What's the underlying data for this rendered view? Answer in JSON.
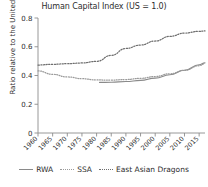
{
  "chart_data": {
    "type": "line",
    "title": "Human Capital Index (US = 1.0)",
    "xlabel": "",
    "ylabel": "Ratio relative to the United States",
    "xlim": [
      1960,
      2017
    ],
    "ylim": [
      0,
      0.8
    ],
    "yticks": [
      "0",
      "0.2",
      "0.4",
      "0.6",
      "0.8"
    ],
    "ytick_values": [
      0,
      0.2,
      0.4,
      0.6,
      0.8
    ],
    "xticks": [
      "1960",
      "1965",
      "1970",
      "1975",
      "1980",
      "1985",
      "1990",
      "1995",
      "2000",
      "2005",
      "2010",
      "2015"
    ],
    "xtick_values": [
      1960,
      1965,
      1970,
      1975,
      1980,
      1985,
      1990,
      1995,
      2000,
      2005,
      2010,
      2015
    ],
    "grid": false,
    "legend_position": "bottom",
    "series": [
      {
        "name": "RWA",
        "style": "solid",
        "color": "#8a8a8a",
        "x": [
          1981,
          1985,
          1990,
          1995,
          2000,
          2005,
          2010,
          2015,
          2017
        ],
        "values": [
          0.352,
          0.353,
          0.358,
          0.366,
          0.382,
          0.405,
          0.437,
          0.475,
          0.488
        ]
      },
      {
        "name": "SSA",
        "style": "fine-dotted",
        "color": "#9a9a9a",
        "x": [
          1960,
          1965,
          1970,
          1975,
          1980,
          1985,
          1990,
          1995,
          2000,
          2005,
          2010,
          2015,
          2017
        ],
        "values": [
          0.432,
          0.408,
          0.39,
          0.378,
          0.369,
          0.368,
          0.372,
          0.38,
          0.393,
          0.412,
          0.436,
          0.468,
          0.482
        ]
      },
      {
        "name": "East Asian Dragons",
        "style": "dotted",
        "color": "#6e6e6e",
        "x": [
          1960,
          1965,
          1970,
          1975,
          1980,
          1985,
          1990,
          1995,
          2000,
          2005,
          2010,
          2015,
          2017
        ],
        "values": [
          0.473,
          0.478,
          0.482,
          0.487,
          0.498,
          0.54,
          0.588,
          0.612,
          0.64,
          0.672,
          0.695,
          0.707,
          0.71
        ]
      }
    ]
  },
  "legend": {
    "items": [
      {
        "label": "RWA",
        "swatch": "line-solid-icon"
      },
      {
        "label": "SSA",
        "swatch": "line-fine-dotted-icon"
      },
      {
        "label": "East Asian Dragons",
        "swatch": "line-dotted-icon"
      }
    ]
  },
  "colors": {
    "axis": "#8c8c8c",
    "text": "#2e2e2e",
    "background": "#ffffff"
  }
}
